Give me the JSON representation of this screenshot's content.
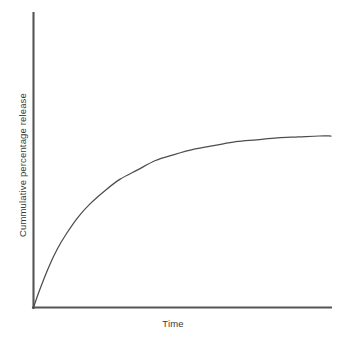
{
  "chart_data": {
    "type": "line",
    "title": "",
    "subtitle": "",
    "xlabel": "Time",
    "ylabel": "Cummulative percentage release",
    "grid": false,
    "legend": false,
    "legend_position": "none",
    "axis_ticks": false,
    "tick_labels_x": [],
    "tick_labels_y": [],
    "xlim": [
      0,
      100
    ],
    "ylim": [
      0,
      100
    ],
    "annotations": [],
    "series": [
      {
        "name": "Cummulative percentage release",
        "color": "#4d4d4d",
        "x": [
          0,
          2,
          5,
          8,
          11,
          15,
          19,
          24,
          29,
          35,
          41,
          47,
          54,
          61,
          68,
          75,
          82,
          89,
          96,
          100
        ],
        "y": [
          0,
          9,
          21,
          31,
          39,
          48,
          55,
          62,
          68,
          73,
          78,
          81,
          84,
          86,
          88,
          89,
          90,
          90.5,
          91,
          91
        ]
      }
    ]
  },
  "figure": {
    "background_color": "#ffffff",
    "axis_color": "#555555",
    "curve_color": "#4d4d4d",
    "label_color": "#3a3a3a"
  },
  "labels": {
    "x_axis": "Time",
    "y_axis": "Cummulative percentage release"
  }
}
